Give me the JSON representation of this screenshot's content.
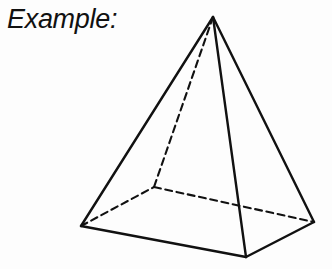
{
  "figure": {
    "label": "Example:",
    "shape_name": "square-pyramid",
    "background_color": "#fdfdfd",
    "stroke_color": "#111111",
    "label_color": "#111111",
    "vertices": {
      "apex": {
        "name": "apex",
        "x": 213,
        "y": 17
      },
      "base_left": {
        "name": "base-left",
        "x": 81,
        "y": 226
      },
      "base_front": {
        "name": "base-front",
        "x": 246,
        "y": 257
      },
      "base_right": {
        "name": "base-right",
        "x": 314,
        "y": 222
      },
      "base_back": {
        "name": "base-back-hidden",
        "x": 154,
        "y": 187
      }
    },
    "edges": [
      {
        "name": "edge-apex-left",
        "from": "apex",
        "to": "base_left",
        "style": "solid",
        "width": 2.4
      },
      {
        "name": "edge-apex-front",
        "from": "apex",
        "to": "base_front",
        "style": "solid",
        "width": 2.4
      },
      {
        "name": "edge-apex-right",
        "from": "apex",
        "to": "base_right",
        "style": "solid",
        "width": 2.4
      },
      {
        "name": "edge-base-left-front",
        "from": "base_left",
        "to": "base_front",
        "style": "solid",
        "width": 2.4
      },
      {
        "name": "edge-base-front-right",
        "from": "base_front",
        "to": "base_right",
        "style": "solid",
        "width": 2.4
      },
      {
        "name": "edge-apex-back",
        "from": "apex",
        "to": "base_back",
        "style": "dashed",
        "width": 2.1
      },
      {
        "name": "edge-base-left-back",
        "from": "base_left",
        "to": "base_back",
        "style": "dashed",
        "width": 2.1
      },
      {
        "name": "edge-base-back-right",
        "from": "base_back",
        "to": "base_right",
        "style": "dashed",
        "width": 2.1
      }
    ],
    "dash_pattern": "7,4.5"
  }
}
